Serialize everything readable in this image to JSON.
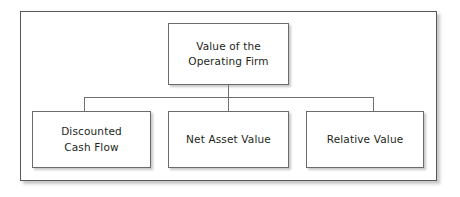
{
  "diagram": {
    "type": "hierarchy-tree",
    "colors": {
      "frame_border": "#57585a",
      "node_border": "#6a6b6d",
      "node_fill": "#ffffff",
      "connector": "#6e6f71",
      "text": "#231f20",
      "background": "#ffffff"
    },
    "root": {
      "id": "value-of-operating-firm",
      "label": "Value of the\nOperating Firm"
    },
    "children": [
      {
        "id": "discounted-cash-flow",
        "label": "Discounted\nCash Flow"
      },
      {
        "id": "net-asset-value",
        "label": "Net Asset Value"
      },
      {
        "id": "relative-value",
        "label": "Relative Value"
      }
    ]
  }
}
